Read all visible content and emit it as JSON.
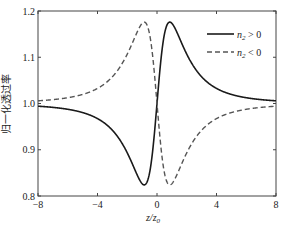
{
  "chart_data": {
    "type": "line",
    "title": "",
    "xlabel": "z/z0",
    "xlabel_parts": {
      "main": "z/z",
      "sub": "0"
    },
    "ylabel": "归一化透过率",
    "xlim": [
      -8,
      8
    ],
    "ylim": [
      0.8,
      1.2
    ],
    "xticks": [
      -8,
      -4,
      0,
      4,
      8
    ],
    "xtick_labels": [
      "−8",
      "−4",
      "0",
      "4",
      "8"
    ],
    "yticks": [
      0.8,
      0.9,
      1.0,
      1.1,
      1.2
    ],
    "ytick_labels": [
      "0.8",
      "0.9",
      "1.0",
      "1.1",
      "1.2"
    ],
    "grid": false,
    "legend_position": "upper right",
    "model": "T(x) = 1 + s*A*4x/((x^2+9)(x^2+1)), A chosen so extremum ≈ ±0.176",
    "series": [
      {
        "name": "n2 > 0",
        "legend": {
          "var": "n",
          "sub": "2",
          "rel": " > 0"
        },
        "style": "solid",
        "color": "#1a1a1a",
        "sign": 1,
        "x": [
          -8,
          -6,
          -4,
          -3,
          -2,
          -1.5,
          -1,
          -0.86,
          -0.5,
          0,
          0.5,
          0.86,
          1,
          1.5,
          2,
          3,
          4,
          6,
          8
        ],
        "values": [
          0.994,
          0.99,
          0.978,
          0.962,
          0.929,
          0.894,
          0.838,
          0.824,
          0.859,
          1.0,
          1.141,
          1.176,
          1.162,
          1.106,
          1.071,
          1.038,
          1.022,
          1.01,
          1.006
        ]
      },
      {
        "name": "n2 < 0",
        "legend": {
          "var": "n",
          "sub": "2",
          "rel": " < 0"
        },
        "style": "dashed",
        "color": "#555555",
        "sign": -1,
        "x": [
          -8,
          -6,
          -4,
          -3,
          -2,
          -1.5,
          -1,
          -0.86,
          -0.5,
          0,
          0.5,
          0.86,
          1,
          1.5,
          2,
          3,
          4,
          6,
          8
        ],
        "values": [
          1.006,
          1.01,
          1.022,
          1.038,
          1.071,
          1.106,
          1.162,
          1.176,
          1.141,
          1.0,
          0.859,
          0.824,
          0.838,
          0.894,
          0.929,
          0.962,
          0.978,
          0.99,
          0.994
        ]
      }
    ],
    "amplitude": 0.176
  }
}
